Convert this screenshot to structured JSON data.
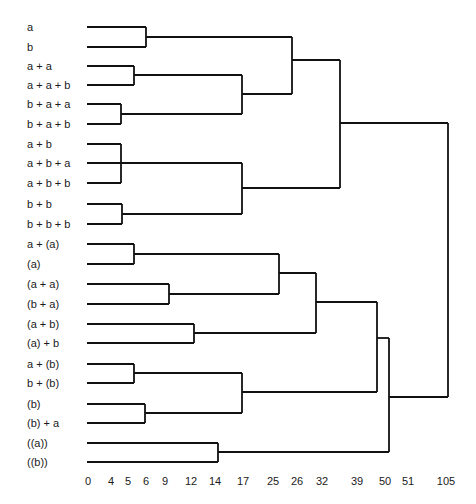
{
  "chart_data": {
    "type": "dendrogram",
    "title": "",
    "orientation": "horizontal",
    "xlabel": "",
    "x_ticks": [
      {
        "label": "0",
        "x": 88
      },
      {
        "label": "4",
        "x": 111
      },
      {
        "label": "5",
        "x": 128
      },
      {
        "label": "6",
        "x": 146
      },
      {
        "label": "9",
        "x": 165
      },
      {
        "label": "12",
        "x": 191
      },
      {
        "label": "14",
        "x": 215
      },
      {
        "label": "17",
        "x": 243
      },
      {
        "label": "25",
        "x": 273
      },
      {
        "label": "26",
        "x": 297
      },
      {
        "label": "32",
        "x": 322
      },
      {
        "label": "39",
        "x": 357
      },
      {
        "label": "50",
        "x": 385
      },
      {
        "label": "51",
        "x": 408
      },
      {
        "label": "105",
        "x": 446
      }
    ],
    "leaves": [
      {
        "label": "a",
        "y": 27
      },
      {
        "label": "b",
        "y": 47
      },
      {
        "label": "a + a",
        "y": 66
      },
      {
        "label": "a + a + b",
        "y": 85
      },
      {
        "label": "b + a + a",
        "y": 104
      },
      {
        "label": "b + a + b",
        "y": 124
      },
      {
        "label": "a + b",
        "y": 144
      },
      {
        "label": "a + b + a",
        "y": 163
      },
      {
        "label": "a + b + b",
        "y": 183
      },
      {
        "label": "b + b",
        "y": 204
      },
      {
        "label": "b + b + b",
        "y": 224
      },
      {
        "label": "a + (a)",
        "y": 244
      },
      {
        "label": "(a)",
        "y": 264
      },
      {
        "label": "(a + a)",
        "y": 284
      },
      {
        "label": "(b + a)",
        "y": 304
      },
      {
        "label": "(a + b)",
        "y": 324
      },
      {
        "label": "(a) + b",
        "y": 343
      },
      {
        "label": "a + (b)",
        "y": 364
      },
      {
        "label": "b + (b)",
        "y": 383
      },
      {
        "label": "(b)",
        "y": 404
      },
      {
        "label": "(b) + a",
        "y": 423
      },
      {
        "label": "((a))",
        "y": 443
      },
      {
        "label": "((b))",
        "y": 462
      }
    ],
    "merges": [
      {
        "members": [
          "a",
          "b"
        ],
        "height": 6
      },
      {
        "members": [
          "a + a",
          "a + a + b"
        ],
        "height": 5
      },
      {
        "members": [
          "b + a + a",
          "b + a + b"
        ],
        "height": 4
      },
      {
        "members": [
          "a + b",
          "a + b + a",
          "a + b + b"
        ],
        "height": 4
      },
      {
        "members": [
          "b + b",
          "b + b + b"
        ],
        "height": 4
      },
      {
        "members": [
          "{a+a, a+a+b}",
          "{b+a+a, b+a+b}"
        ],
        "height": 17
      },
      {
        "members": [
          "{a+b, a+b+a, a+b+b}",
          "{b+b, b+b+b}"
        ],
        "height": 17
      },
      {
        "members": [
          "{a, b}",
          "{a+a ... b+a+b}"
        ],
        "height": 26
      },
      {
        "members": [
          "{a ... b+a+b}",
          "{a+b ... b+b+b}"
        ],
        "height": 39
      },
      {
        "members": [
          "a + (a)",
          "(a)"
        ],
        "height": 5
      },
      {
        "members": [
          "(a + a)",
          "(b + a)"
        ],
        "height": 9
      },
      {
        "members": [
          "{a+(a), (a)}",
          "{(a+a), (b+a)}"
        ],
        "height": 25
      },
      {
        "members": [
          "(a + b)",
          "(a) + b"
        ],
        "height": 12
      },
      {
        "members": [
          "{a+(a) ... (b+a)}",
          "{(a+b), (a)+b}"
        ],
        "height": 32
      },
      {
        "members": [
          "a + (b)",
          "b + (b)"
        ],
        "height": 5
      },
      {
        "members": [
          "(b)",
          "(b) + a"
        ],
        "height": 6
      },
      {
        "members": [
          "{a+(b), b+(b)}",
          "{(b), (b)+a}"
        ],
        "height": 17
      },
      {
        "members": [
          "{a+(a) ... (a)+b}",
          "{a+(b) ... (b)+a}"
        ],
        "height": 50
      },
      {
        "members": [
          "((a))",
          "((b))"
        ],
        "height": 14
      },
      {
        "members": [
          "{a+(a) ... (b)+a}",
          "{((a)), ((b))}"
        ],
        "height": 51
      },
      {
        "members": [
          "upper cluster",
          "lower cluster"
        ],
        "height": 105
      }
    ],
    "segments": [
      [
        87,
        27,
        146,
        27
      ],
      [
        87,
        47,
        146,
        47
      ],
      [
        146,
        27,
        146,
        47
      ],
      [
        146,
        37,
        292,
        37
      ],
      [
        87,
        66,
        134,
        66
      ],
      [
        87,
        85,
        134,
        85
      ],
      [
        134,
        66,
        134,
        85
      ],
      [
        134,
        75,
        242,
        75
      ],
      [
        87,
        104,
        121,
        104
      ],
      [
        87,
        124,
        121,
        124
      ],
      [
        121,
        104,
        121,
        124
      ],
      [
        121,
        114,
        242,
        114
      ],
      [
        242,
        75,
        242,
        114
      ],
      [
        242,
        94,
        292,
        94
      ],
      [
        292,
        37,
        292,
        94
      ],
      [
        292,
        60,
        340,
        60
      ],
      [
        87,
        144,
        121,
        144
      ],
      [
        87,
        163,
        121,
        163
      ],
      [
        87,
        183,
        121,
        183
      ],
      [
        121,
        144,
        121,
        183
      ],
      [
        121,
        163,
        242,
        163
      ],
      [
        87,
        204,
        122,
        204
      ],
      [
        87,
        224,
        122,
        224
      ],
      [
        122,
        204,
        122,
        224
      ],
      [
        122,
        214,
        242,
        214
      ],
      [
        242,
        163,
        242,
        214
      ],
      [
        242,
        188,
        340,
        188
      ],
      [
        340,
        60,
        340,
        188
      ],
      [
        340,
        123,
        448,
        123
      ],
      [
        87,
        244,
        134,
        244
      ],
      [
        87,
        264,
        134,
        264
      ],
      [
        134,
        244,
        134,
        264
      ],
      [
        134,
        254,
        279,
        254
      ],
      [
        87,
        284,
        169,
        284
      ],
      [
        87,
        304,
        169,
        304
      ],
      [
        169,
        284,
        169,
        304
      ],
      [
        169,
        294,
        279,
        294
      ],
      [
        279,
        254,
        279,
        294
      ],
      [
        279,
        273,
        316,
        273
      ],
      [
        87,
        324,
        194,
        324
      ],
      [
        87,
        343,
        194,
        343
      ],
      [
        194,
        324,
        194,
        343
      ],
      [
        194,
        333,
        316,
        333
      ],
      [
        316,
        273,
        316,
        333
      ],
      [
        316,
        302,
        377,
        302
      ],
      [
        87,
        364,
        134,
        364
      ],
      [
        87,
        383,
        134,
        383
      ],
      [
        134,
        364,
        134,
        383
      ],
      [
        134,
        373,
        242,
        373
      ],
      [
        87,
        404,
        145,
        404
      ],
      [
        87,
        423,
        145,
        423
      ],
      [
        145,
        404,
        145,
        423
      ],
      [
        145,
        413,
        242,
        413
      ],
      [
        242,
        373,
        242,
        413
      ],
      [
        242,
        392,
        377,
        392
      ],
      [
        377,
        302,
        377,
        392
      ],
      [
        377,
        338,
        389,
        338
      ],
      [
        87,
        443,
        218,
        443
      ],
      [
        87,
        462,
        218,
        462
      ],
      [
        218,
        443,
        218,
        462
      ],
      [
        218,
        452,
        389,
        452
      ],
      [
        389,
        338,
        389,
        452
      ],
      [
        389,
        397,
        448,
        397
      ],
      [
        448,
        123,
        448,
        397
      ]
    ]
  }
}
